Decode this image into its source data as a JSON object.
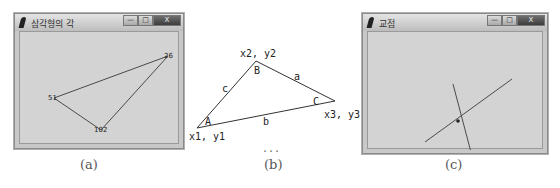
{
  "panel_a": {
    "window_title": "삼각형의 각",
    "controls": {
      "minimize": "—",
      "maximize": "□",
      "close": "X"
    },
    "vertex_labels": [
      "51",
      "102",
      "26"
    ],
    "caption": "(a)"
  },
  "panel_b": {
    "points": {
      "p1": "x1, y1",
      "p2": "x2, y2",
      "p3": "x3, y3"
    },
    "angles": {
      "A": "A",
      "B": "B",
      "C": "C"
    },
    "sides": {
      "a": "a",
      "b": "b",
      "c": "c"
    },
    "ellipsis": "...",
    "caption": "(b)"
  },
  "panel_c": {
    "window_title": "교점",
    "controls": {
      "minimize": "—",
      "maximize": "□",
      "close": "X"
    },
    "caption": "(c)"
  },
  "colors": {
    "canvas_bg": "#d3d3d3",
    "line": "#4a4a4a"
  }
}
